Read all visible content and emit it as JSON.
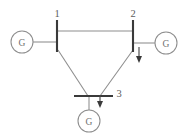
{
  "diagram": {
    "canvas": {
      "width": 191,
      "height": 137,
      "background": "#ffffff"
    },
    "colors": {
      "bus": "#3a3a3a",
      "line": "#8d8d8d",
      "load": "#3a3a3a",
      "label": "#5d5d5d",
      "generator_text": "#6f6f6f"
    },
    "buses": [
      {
        "id": "bus-1",
        "label": "1",
        "orientation": "vertical",
        "x": 57,
        "y1": 20,
        "y2": 52,
        "label_x": 57,
        "label_y": 13
      },
      {
        "id": "bus-2",
        "label": "2",
        "orientation": "vertical",
        "x": 133,
        "y1": 20,
        "y2": 52,
        "label_x": 133,
        "label_y": 13
      },
      {
        "id": "bus-3",
        "label": "3",
        "orientation": "horizontal",
        "y": 96,
        "x1": 74,
        "x2": 113,
        "label_x": 119,
        "label_y": 93
      }
    ],
    "generators": [
      {
        "id": "gen-1",
        "label": "G",
        "cx": 22,
        "cy": 42,
        "r": 11,
        "lead_from_x": 33,
        "lead_to_x": 57,
        "lead_y": 42,
        "attached_bus": "bus-1"
      },
      {
        "id": "gen-2",
        "label": "G",
        "cx": 166,
        "cy": 43,
        "r": 11,
        "lead_from_x": 155,
        "lead_to_x": 133,
        "lead_y": 43,
        "attached_bus": "bus-2"
      },
      {
        "id": "gen-3",
        "label": "G",
        "cx": 89,
        "cy": 121,
        "r": 11,
        "lead_from_y": 110,
        "lead_to_y": 96,
        "lead_x": 89,
        "attached_bus": "bus-3"
      }
    ],
    "lines": [
      {
        "id": "line-1-2",
        "from": "bus-1",
        "to": "bus-2",
        "points": "57,31 133,31"
      },
      {
        "id": "line-1-3",
        "from": "bus-1",
        "to": "bus-3",
        "points": "58,50 88,96"
      },
      {
        "id": "line-2-3",
        "from": "bus-2",
        "to": "bus-3",
        "points": "133,50 100,96"
      }
    ],
    "loads": [
      {
        "id": "load-bus-2",
        "at_bus": "bus-2",
        "x": 139,
        "y_top": 48,
        "y_bottom": 62,
        "direction": "down"
      },
      {
        "id": "load-bus-3",
        "at_bus": "bus-3",
        "x": 100,
        "y_top": 96,
        "y_bottom": 108,
        "direction": "down"
      }
    ]
  }
}
